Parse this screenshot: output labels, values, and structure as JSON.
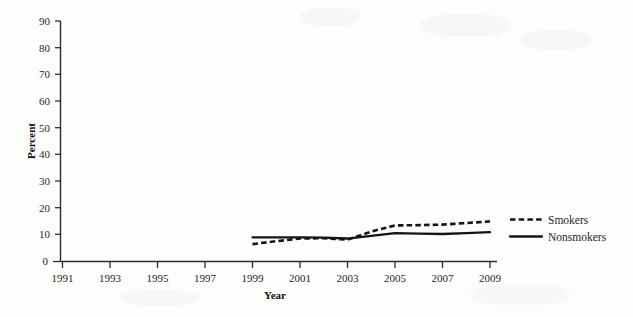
{
  "chart_data": {
    "type": "line",
    "title": "",
    "xlabel": "Year",
    "ylabel": "Percent",
    "xlim": [
      1991,
      2009
    ],
    "ylim": [
      0,
      90
    ],
    "grid": false,
    "legend_position": "right",
    "x_ticks": [
      1991,
      1993,
      1995,
      1997,
      1999,
      2001,
      2003,
      2005,
      2007,
      2009
    ],
    "y_ticks": [
      0,
      10,
      20,
      30,
      40,
      50,
      60,
      70,
      80,
      90
    ],
    "x": [
      1999,
      2000,
      2001,
      2002,
      2003,
      2004,
      2005,
      2006,
      2007,
      2008,
      2009
    ],
    "series": [
      {
        "name": "Smokers",
        "style": "dashed",
        "color": "#141414",
        "values": [
          6.5,
          7.6,
          8.6,
          8.7,
          8.2,
          11.2,
          13.5,
          13.6,
          13.8,
          14.4,
          15.0
        ]
      },
      {
        "name": "Nonsmokers",
        "style": "solid",
        "color": "#141414",
        "values": [
          9.0,
          9.0,
          9.0,
          8.9,
          8.6,
          9.6,
          10.6,
          10.4,
          10.3,
          10.6,
          11.0
        ]
      }
    ]
  },
  "axes": {
    "y_axis_title": "Percent",
    "x_axis_title": "Year",
    "y_tick_labels": [
      "90",
      "80",
      "70",
      "60",
      "50",
      "40",
      "30",
      "20",
      "10",
      "0"
    ],
    "x_tick_labels": [
      "1991",
      "1993",
      "1995",
      "1997",
      "1999",
      "2001",
      "2003",
      "2005",
      "2007",
      "2009"
    ]
  },
  "legend": {
    "entries": [
      {
        "label": "Smokers",
        "style": "dashed"
      },
      {
        "label": "Nonsmokers",
        "style": "solid"
      }
    ]
  }
}
